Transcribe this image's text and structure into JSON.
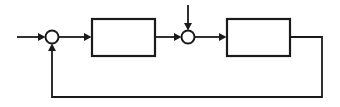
{
  "diagram": {
    "type": "block-diagram",
    "background_color": "#ffffff",
    "stroke_color": "#1a1a1a",
    "block_fill_color": "#ffffff",
    "junction_fill_color": "#ffffff",
    "stroke_width_block": 2.2,
    "stroke_width_wire": 1.8,
    "blocks": [
      {
        "id": "block-1",
        "label": "",
        "x": 92,
        "y": 19,
        "width": 63,
        "height": 37
      },
      {
        "id": "block-2",
        "label": "",
        "x": 227,
        "y": 19,
        "width": 63,
        "height": 37
      }
    ],
    "junctions": [
      {
        "id": "summing-junction-1",
        "label": "",
        "cx": 52,
        "cy": 37,
        "r": 6.5
      },
      {
        "id": "summing-junction-2",
        "label": "",
        "cx": 188,
        "cy": 37,
        "r": 6.5
      }
    ],
    "signals": [
      {
        "id": "input-signal",
        "label": "",
        "path": "M 17 37 L 44 37",
        "arrow_at": "end",
        "arrow_direction": "right",
        "arrow_tip_x": 45.5,
        "arrow_tip_y": 37
      },
      {
        "id": "junction1-to-block1",
        "label": "",
        "path": "M 58.5 37 L 90 37",
        "arrow_at": "end",
        "arrow_direction": "right",
        "arrow_tip_x": 91.5,
        "arrow_tip_y": 37
      },
      {
        "id": "block1-to-junction2",
        "label": "",
        "path": "M 155 37 L 180 37",
        "arrow_at": "end",
        "arrow_direction": "right",
        "arrow_tip_x": 181.5,
        "arrow_tip_y": 37
      },
      {
        "id": "disturbance-input",
        "label": "",
        "path": "M 188 5 L 188 29",
        "arrow_at": "end",
        "arrow_direction": "down",
        "arrow_tip_x": 188,
        "arrow_tip_y": 30.5
      },
      {
        "id": "junction2-to-block2",
        "label": "",
        "path": "M 194.5 37 L 225 37",
        "arrow_at": "end",
        "arrow_direction": "right",
        "arrow_tip_x": 226.5,
        "arrow_tip_y": 37
      },
      {
        "id": "feedback-path",
        "label": "",
        "path": "M 290 37 L 322 37 L 322 97 L 52 97 L 52 45",
        "arrow_at": "end",
        "arrow_direction": "up",
        "arrow_tip_x": 52,
        "arrow_tip_y": 43.5
      }
    ],
    "arrowheads": [
      {
        "id": "arrowhead-input",
        "direction": "right",
        "points": "45.5,37 38,33 38,41"
      },
      {
        "id": "arrowhead-junction1-to-block1",
        "direction": "right",
        "points": "91.5,37 84,33 84,41"
      },
      {
        "id": "arrowhead-block1-to-junction2",
        "direction": "right",
        "points": "181.5,37 174,33 174,41"
      },
      {
        "id": "arrowhead-disturbance",
        "direction": "down",
        "points": "188,30.5 184,23 192,23"
      },
      {
        "id": "arrowhead-junction2-to-block2",
        "direction": "right",
        "points": "226.5,37 219,33 219,41"
      },
      {
        "id": "arrowhead-feedback",
        "direction": "up",
        "points": "52,43.5 48,51 56,51"
      }
    ]
  }
}
